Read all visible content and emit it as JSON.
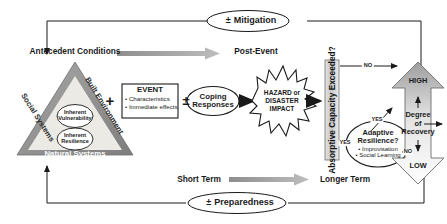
{
  "figure": {
    "type": "flow-diagram"
  },
  "top_loop": {
    "label": "Mitigation",
    "sign": "±"
  },
  "bottom_loop": {
    "label": "Preparedness",
    "sign": "±"
  },
  "phase_labels": {
    "antecedent": "Antecedent Conditions",
    "post_event": "Post-Event",
    "short_term": "Short Term",
    "longer_term": "Longer Term"
  },
  "triangle": {
    "left_side": "Social Systems",
    "right_side": "Built Environment",
    "bottom_side": "Natural Systems",
    "inner_top": {
      "line1": "Inherent",
      "line2": "Vulnerability"
    },
    "inner_bottom": {
      "line1": "Inherent",
      "line2": "Resilience"
    }
  },
  "event_box": {
    "title": "EVENT",
    "bullets": [
      "• Characteristics",
      "• Immediate effects"
    ]
  },
  "operators": {
    "plus": "+",
    "plus_minus_1": "±",
    "plus_minus_2": "±"
  },
  "coping": {
    "line1": "Coping",
    "line2": "Responses"
  },
  "hazard_star": {
    "line1": "HAZARD or",
    "line2": "DISASTER",
    "line3": "IMPACT"
  },
  "absorptive_bar": {
    "label": "Absorptive Capacity Exceeded?"
  },
  "decisions": {
    "no_top": "NO",
    "yes_bar": "YES",
    "yes_adaptive": "YES",
    "no_adaptive": "NO"
  },
  "adaptive_circle": {
    "line1": "Adaptive",
    "line2": "Resilience?",
    "bullets": [
      "• Improvisation",
      "• Social Learning"
    ]
  },
  "recovery_arrow": {
    "high": "HIGH",
    "low": "LOW",
    "center_line1": "Degree",
    "center_line2": "of",
    "center_line3": "Recovery"
  },
  "colors": {
    "ink": "#1a1a1a",
    "gray_fill": "#9a9a9a",
    "gray_light": "#d9d9d9",
    "gray_mid": "#b5b5b5",
    "triangle_outer": "#8c8c8c",
    "triangle_inner": "#e8e6e0",
    "bar_fill": "#d0d0d0",
    "white": "#ffffff"
  }
}
